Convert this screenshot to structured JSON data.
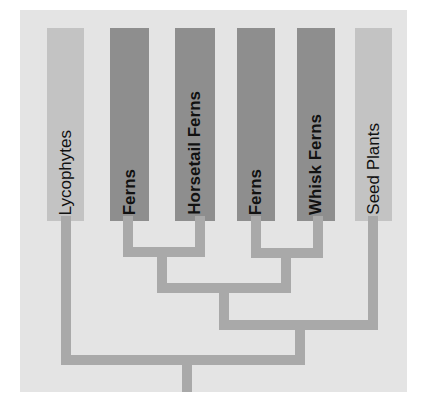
{
  "colors": {
    "background": "#e4e4e4",
    "light_bar": "#c3c3c3",
    "dark_bar": "#8e8e8e",
    "branch": "#a9a9a9"
  },
  "taxa": [
    {
      "label": "Lycophytes",
      "style": "light"
    },
    {
      "label": "Ferns",
      "style": "dark"
    },
    {
      "label": "Horsetail Ferns",
      "style": "dark"
    },
    {
      "label": "Ferns",
      "style": "dark"
    },
    {
      "label": "Whisk Ferns",
      "style": "dark"
    },
    {
      "label": "Seed Plants",
      "style": "light"
    }
  ]
}
